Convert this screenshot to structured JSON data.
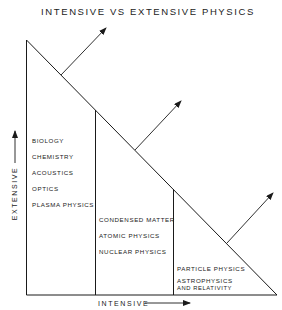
{
  "title": "INTENSIVE VS EXTENSIVE PHYSICS",
  "axes": {
    "x_label": "INTENSIVE",
    "y_label": "EXTENSIVE"
  },
  "regions": [
    {
      "name": "extensive",
      "labels": [
        "BIOLOGY",
        "CHEMISTRY",
        "ACOUSTICS",
        "OPTICS",
        "PLASMA PHYSICS"
      ]
    },
    {
      "name": "intermediate",
      "labels": [
        "CONDENSED MATTER",
        "ATOMIC PHYSICS",
        "NUCLEAR PHYSICS"
      ]
    },
    {
      "name": "intensive",
      "labels": [
        "PARTICLE PHYSICS",
        "ASTROPHYSICS",
        "AND RELATIVITY"
      ]
    }
  ],
  "colors": {
    "line": "#1a1a1a",
    "background": "#ffffff"
  }
}
